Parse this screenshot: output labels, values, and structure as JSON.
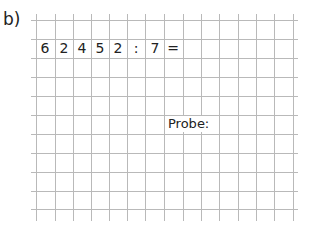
{
  "exercise": {
    "label": "b)",
    "problem": {
      "cells": [
        "6",
        "2",
        "4",
        "5",
        "2",
        ":",
        "7",
        "="
      ],
      "expression": "62452 : 7 ="
    },
    "probe_label": "Probe:"
  },
  "grid": {
    "columns": 14,
    "rows": 10,
    "line_color": "#b9b9b9",
    "text_color": "#222222"
  }
}
